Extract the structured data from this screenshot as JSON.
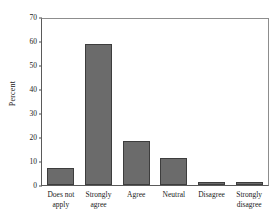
{
  "chart_data": {
    "type": "bar",
    "title": "",
    "xlabel": "",
    "ylabel": "Percent",
    "categories": [
      "Does not apply",
      "Strongly agree",
      "Agree",
      "Neutral",
      "Disagree",
      "Strongly disagree"
    ],
    "category_lines": [
      [
        "Does not",
        "apply"
      ],
      [
        "Strongly",
        "agree"
      ],
      [
        "Agree",
        ""
      ],
      [
        "Neutral",
        ""
      ],
      [
        "Disagree",
        ""
      ],
      [
        "Strongly",
        "disagree"
      ]
    ],
    "values": [
      7.0,
      59.5,
      18.5,
      11.5,
      1.3,
      1.3
    ],
    "ylim": [
      0,
      70
    ],
    "yticks": [
      0,
      10,
      20,
      30,
      40,
      50,
      60,
      70
    ],
    "ytick_labels": [
      "0",
      "10",
      "20",
      "30",
      "40",
      "50",
      "60",
      "70"
    ],
    "grid": false,
    "legend": false,
    "bar_color": "#6b6b6b",
    "bar_edge_color": "#3d3d3d",
    "axis_color": "#5a5a5a",
    "background": "#ffffff"
  }
}
